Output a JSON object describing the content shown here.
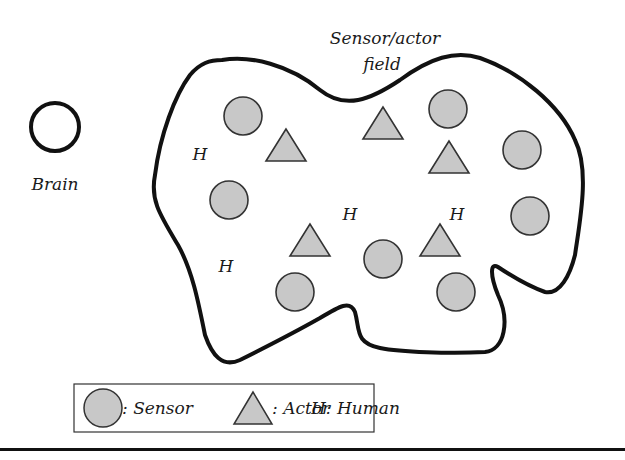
{
  "diagram": {
    "brain": {
      "label": "Brain",
      "cx": 55,
      "cy": 127,
      "r": 25
    },
    "field": {
      "label_line1": "Sensor/actor",
      "label_line2": "field"
    },
    "sensors": [
      {
        "cx": 243,
        "cy": 116
      },
      {
        "cx": 229,
        "cy": 200
      },
      {
        "cx": 448,
        "cy": 109
      },
      {
        "cx": 522,
        "cy": 150
      },
      {
        "cx": 530,
        "cy": 216
      },
      {
        "cx": 383,
        "cy": 259
      },
      {
        "cx": 295,
        "cy": 292
      },
      {
        "cx": 456,
        "cy": 292
      }
    ],
    "actors": [
      {
        "cx": 286,
        "cy": 145
      },
      {
        "cx": 383,
        "cy": 123
      },
      {
        "cx": 449,
        "cy": 157
      },
      {
        "cx": 310,
        "cy": 240
      },
      {
        "cx": 440,
        "cy": 240
      }
    ],
    "humans": [
      {
        "label": "H",
        "x": 200,
        "y": 160
      },
      {
        "label": "H",
        "x": 350,
        "y": 220
      },
      {
        "label": "H",
        "x": 457,
        "y": 220
      },
      {
        "label": "H",
        "x": 226,
        "y": 272
      }
    ],
    "legend": {
      "sensor_label": ": Sensor",
      "actor_label": ": Actor",
      "human_label": "H: Human"
    },
    "colors": {
      "fill": "#c8c8c8",
      "stroke": "#111111",
      "background": "#ffffff"
    }
  }
}
